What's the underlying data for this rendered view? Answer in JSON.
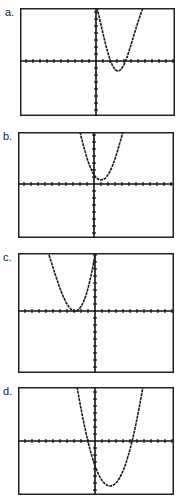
{
  "colors": {
    "frame": "#222222",
    "axis": "#111111",
    "curve": "#1a1a1a",
    "background": "#ffffff"
  },
  "panels": [
    {
      "label": "a.",
      "box": [
        20,
        8,
        155,
        108
      ],
      "origin": [
        76,
        53
      ],
      "curve": "M77 0 C 84 28, 90 63, 98 63 C 106 63, 112 28, 123 0"
    },
    {
      "label": "b.",
      "box": [
        18,
        132,
        156,
        106
      ],
      "origin": [
        76,
        52
      ],
      "curve": "M62 0 C 68 24, 74 48, 83 48 C 92 48, 98 24, 105 0"
    },
    {
      "label": "c.",
      "box": [
        18,
        253,
        156,
        120
      ],
      "origin": [
        77,
        58
      ],
      "curve": "M31 2 C 40 30, 48 58, 57 58 C 66 58, 72 30, 77 2"
    },
    {
      "label": "d.",
      "box": [
        18,
        387,
        156,
        108
      ],
      "origin": [
        77,
        54
      ],
      "curve": "M59 0 C 68 50, 78 99, 92 99 C 106 99, 116 50, 125 0"
    }
  ],
  "chart_data": [
    {
      "type": "line",
      "title": "a.",
      "description": "Upward parabola, vertex below x-axis to the right of y-axis, two positive roots",
      "vertex": [
        3,
        -1.5
      ],
      "roots": [
        1.5,
        4.5
      ],
      "grid": false
    },
    {
      "type": "line",
      "title": "b.",
      "description": "Upward parabola, vertex above x-axis just right of y-axis, no real roots",
      "vertex": [
        1,
        0.5
      ],
      "roots": [],
      "grid": false
    },
    {
      "type": "line",
      "title": "c.",
      "description": "Upward parabola, vertex on x-axis left of y-axis, one repeated negative root",
      "vertex": [
        -2.5,
        0
      ],
      "roots": [
        -2.5
      ],
      "grid": false
    },
    {
      "type": "line",
      "title": "d.",
      "description": "Upward parabola, vertex well below x-axis right of y-axis, one negative and one positive root",
      "vertex": [
        2,
        -7
      ],
      "roots": [
        -1,
        4
      ],
      "grid": false
    }
  ]
}
